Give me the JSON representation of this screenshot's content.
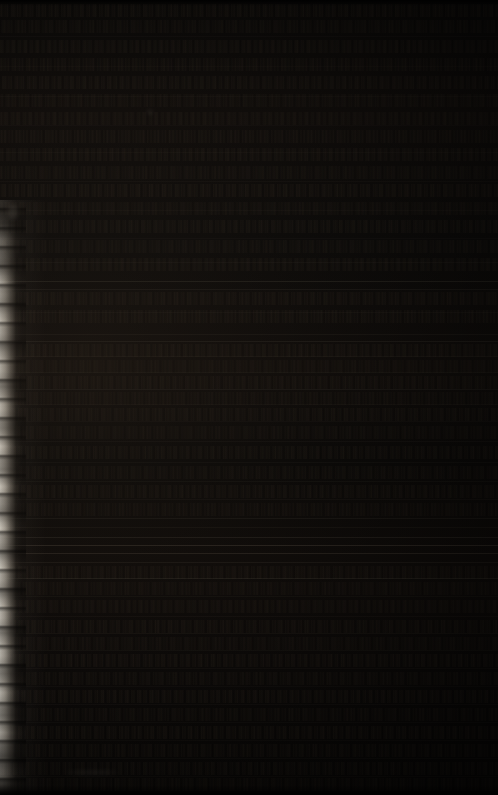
{
  "image": {
    "title": "Underexposed manuscript page photograph",
    "subject": "dense handwritten text page",
    "width": 498,
    "height": 795,
    "exposure": "severely underexposed",
    "legible_text": "none",
    "description": "A very dark photograph of a densely written manuscript page. Rows of small script run edge to edge, separated by faint horizontal ruled lines. A bright, ragged, illuminated page edge runs down the left side of the frame."
  },
  "palette": {
    "background": "#000000",
    "paper_shadow": "#0a0908",
    "paper_midtone": "#100d0b",
    "ink": "#48392c",
    "rule_line": "#4a443a",
    "page_edge_highlight": "#ece7dc",
    "page_edge_midtone": "#968f83"
  },
  "page_edge": {
    "side": "left",
    "top": 208,
    "height": 587,
    "width": 22
  },
  "rules": [
    {
      "y": 36,
      "opacity": 0.1
    },
    {
      "y": 66,
      "opacity": 0.09
    },
    {
      "y": 96,
      "opacity": 0.11
    },
    {
      "y": 125,
      "opacity": 0.09
    },
    {
      "y": 152,
      "opacity": 0.1
    },
    {
      "y": 181,
      "opacity": 0.12
    },
    {
      "y": 210,
      "opacity": 0.1
    },
    {
      "y": 238,
      "opacity": 0.11
    },
    {
      "y": 262,
      "opacity": 0.13
    },
    {
      "y": 281,
      "opacity": 0.34
    },
    {
      "y": 289,
      "opacity": 0.22
    },
    {
      "y": 312,
      "opacity": 0.12
    },
    {
      "y": 334,
      "opacity": 0.18
    },
    {
      "y": 341,
      "opacity": 0.26
    },
    {
      "y": 356,
      "opacity": 0.16
    },
    {
      "y": 372,
      "opacity": 0.14
    },
    {
      "y": 389,
      "opacity": 0.22
    },
    {
      "y": 404,
      "opacity": 0.12
    },
    {
      "y": 421,
      "opacity": 0.11
    },
    {
      "y": 441,
      "opacity": 0.13
    },
    {
      "y": 462,
      "opacity": 0.12
    },
    {
      "y": 481,
      "opacity": 0.14
    },
    {
      "y": 499,
      "opacity": 0.13
    },
    {
      "y": 518,
      "opacity": 0.2
    },
    {
      "y": 527,
      "opacity": 0.16
    },
    {
      "y": 537,
      "opacity": 0.3
    },
    {
      "y": 545,
      "opacity": 0.46
    },
    {
      "y": 553,
      "opacity": 0.4
    },
    {
      "y": 562,
      "opacity": 0.24
    },
    {
      "y": 578,
      "opacity": 0.3
    },
    {
      "y": 596,
      "opacity": 0.14
    },
    {
      "y": 616,
      "opacity": 0.13
    },
    {
      "y": 633,
      "opacity": 0.16
    },
    {
      "y": 650,
      "opacity": 0.14
    },
    {
      "y": 668,
      "opacity": 0.13
    },
    {
      "y": 686,
      "opacity": 0.12
    },
    {
      "y": 704,
      "opacity": 0.13
    },
    {
      "y": 722,
      "opacity": 0.12
    },
    {
      "y": 740,
      "opacity": 0.11
    },
    {
      "y": 758,
      "opacity": 0.12
    },
    {
      "y": 776,
      "opacity": 0.1
    }
  ],
  "script_rows": [
    {
      "y": 4,
      "h": 13,
      "opacity": 0.5,
      "density": 6.3
    },
    {
      "y": 20,
      "h": 13,
      "opacity": 0.46,
      "density": 6.8
    },
    {
      "y": 40,
      "h": 13,
      "opacity": 0.52,
      "density": 5.9
    },
    {
      "y": 58,
      "h": 13,
      "opacity": 0.44,
      "density": 7.1
    },
    {
      "y": 76,
      "h": 13,
      "opacity": 0.48,
      "density": 6.2
    },
    {
      "y": 94,
      "h": 13,
      "opacity": 0.42,
      "density": 6.6
    },
    {
      "y": 112,
      "h": 13,
      "opacity": 0.5,
      "density": 6.0
    },
    {
      "y": 130,
      "h": 13,
      "opacity": 0.45,
      "density": 7.3
    },
    {
      "y": 148,
      "h": 13,
      "opacity": 0.47,
      "density": 6.1
    },
    {
      "y": 166,
      "h": 13,
      "opacity": 0.43,
      "density": 6.9
    },
    {
      "y": 184,
      "h": 13,
      "opacity": 0.49,
      "density": 6.4
    },
    {
      "y": 202,
      "h": 13,
      "opacity": 0.44,
      "density": 7.0
    },
    {
      "y": 220,
      "h": 13,
      "opacity": 0.46,
      "density": 6.2
    },
    {
      "y": 240,
      "h": 13,
      "opacity": 0.41,
      "density": 6.7
    },
    {
      "y": 258,
      "h": 13,
      "opacity": 0.45,
      "density": 6.0
    },
    {
      "y": 292,
      "h": 13,
      "opacity": 0.47,
      "density": 6.5
    },
    {
      "y": 310,
      "h": 13,
      "opacity": 0.43,
      "density": 7.2
    },
    {
      "y": 344,
      "h": 13,
      "opacity": 0.46,
      "density": 6.1
    },
    {
      "y": 360,
      "h": 13,
      "opacity": 0.4,
      "density": 6.8
    },
    {
      "y": 376,
      "h": 13,
      "opacity": 0.44,
      "density": 6.3
    },
    {
      "y": 392,
      "h": 13,
      "opacity": 0.38,
      "density": 7.0
    },
    {
      "y": 408,
      "h": 13,
      "opacity": 0.42,
      "density": 6.4
    },
    {
      "y": 426,
      "h": 13,
      "opacity": 0.39,
      "density": 6.9
    },
    {
      "y": 446,
      "h": 13,
      "opacity": 0.43,
      "density": 6.2
    },
    {
      "y": 466,
      "h": 13,
      "opacity": 0.4,
      "density": 6.6
    },
    {
      "y": 485,
      "h": 13,
      "opacity": 0.44,
      "density": 6.1
    },
    {
      "y": 503,
      "h": 13,
      "opacity": 0.38,
      "density": 7.1
    },
    {
      "y": 566,
      "h": 13,
      "opacity": 0.45,
      "density": 6.3
    },
    {
      "y": 582,
      "h": 13,
      "opacity": 0.41,
      "density": 6.8
    },
    {
      "y": 600,
      "h": 13,
      "opacity": 0.47,
      "density": 6.0
    },
    {
      "y": 620,
      "h": 13,
      "opacity": 0.5,
      "density": 6.5
    },
    {
      "y": 637,
      "h": 13,
      "opacity": 0.46,
      "density": 7.0
    },
    {
      "y": 654,
      "h": 13,
      "opacity": 0.52,
      "density": 6.2
    },
    {
      "y": 672,
      "h": 13,
      "opacity": 0.48,
      "density": 6.7
    },
    {
      "y": 690,
      "h": 13,
      "opacity": 0.54,
      "density": 6.1
    },
    {
      "y": 708,
      "h": 13,
      "opacity": 0.5,
      "density": 6.9
    },
    {
      "y": 726,
      "h": 13,
      "opacity": 0.53,
      "density": 6.3
    },
    {
      "y": 744,
      "h": 13,
      "opacity": 0.49,
      "density": 6.6
    },
    {
      "y": 762,
      "h": 13,
      "opacity": 0.46,
      "density": 6.2
    },
    {
      "y": 778,
      "h": 13,
      "opacity": 0.42,
      "density": 6.8
    }
  ],
  "smudges": [
    {
      "x": 66,
      "y": 771,
      "w": 52,
      "h": 3,
      "opacity": 0.16
    },
    {
      "x": 148,
      "y": 110,
      "w": 4,
      "h": 4,
      "opacity": 0.22
    },
    {
      "x": 8,
      "y": 205,
      "w": 10,
      "h": 14,
      "opacity": 0.18
    }
  ]
}
